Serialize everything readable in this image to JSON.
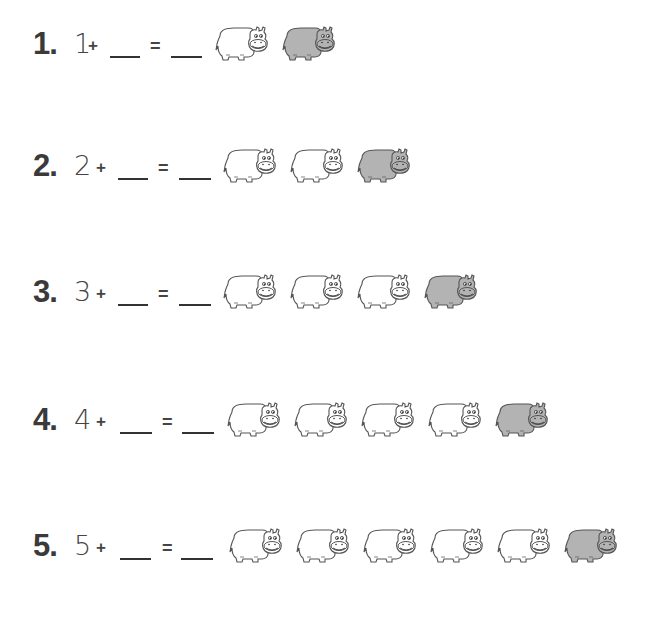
{
  "worksheet": {
    "colors": {
      "hippo_fill_white": "#ffffff",
      "hippo_fill_gray": "#b3b3b3",
      "ink": "#3a3a3a"
    },
    "problems": [
      {
        "number": "1.",
        "addend": "1",
        "plus": "+",
        "equals": "=",
        "blank1": "",
        "blank2": "",
        "white_hippos": 1,
        "gray_hippos": 1
      },
      {
        "number": "2.",
        "addend": "2",
        "plus": "+",
        "equals": "=",
        "blank1": "",
        "blank2": "",
        "white_hippos": 2,
        "gray_hippos": 1
      },
      {
        "number": "3.",
        "addend": "3",
        "plus": "+",
        "equals": "=",
        "blank1": "",
        "blank2": "",
        "white_hippos": 3,
        "gray_hippos": 1
      },
      {
        "number": "4.",
        "addend": "4",
        "plus": "+",
        "equals": "=",
        "blank1": "",
        "blank2": "",
        "white_hippos": 4,
        "gray_hippos": 1
      },
      {
        "number": "5.",
        "addend": "5",
        "plus": "+",
        "equals": "=",
        "blank1": "",
        "blank2": "",
        "white_hippos": 5,
        "gray_hippos": 1
      }
    ]
  }
}
